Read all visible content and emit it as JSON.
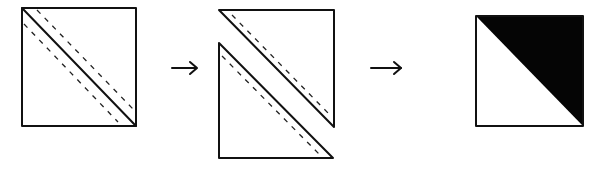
{
  "diagram": {
    "steps": [
      {
        "id": "step-1",
        "label": "Stacked squares with diagonal cut line and two seam lines",
        "shape": "square",
        "elements": [
          "solid-diagonal-cut-line",
          "dashed-seam-line-above",
          "dashed-seam-line-below"
        ]
      },
      {
        "id": "step-2",
        "label": "Square cut along diagonal into two triangles, each with a seam line",
        "shape": "two-triangles",
        "elements": [
          "upper-right-triangle",
          "lower-left-triangle",
          "dashed-seam-lines"
        ]
      },
      {
        "id": "step-3",
        "label": "Pressed half-square triangle block",
        "shape": "square",
        "elements": [
          "white-lower-left-triangle",
          "black-upper-right-triangle"
        ]
      }
    ],
    "arrows": [
      {
        "from": "step-1",
        "to": "step-2",
        "glyph": "→"
      },
      {
        "from": "step-2",
        "to": "step-3",
        "glyph": "→"
      }
    ],
    "colors": {
      "line": "#111111",
      "dark_fabric": "#050505",
      "light_fabric": "#ffffff",
      "background": "#ffffff"
    }
  }
}
